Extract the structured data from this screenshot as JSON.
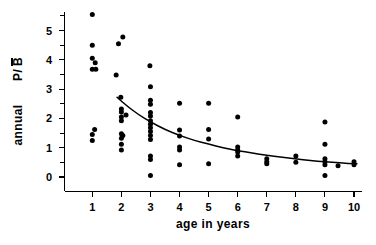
{
  "chart_data": {
    "type": "scatter",
    "title": "",
    "xlabel": "age  in  years",
    "ylabel": "annual  P/B̄",
    "ylabel_parts": {
      "word": "annual",
      "symbol_p": "P/",
      "symbol_b": "B",
      "has_overbar_on_b": true
    },
    "xlim": [
      0.35,
      10.55
    ],
    "ylim": [
      -0.35,
      5.75
    ],
    "xticks": [
      1,
      2,
      3,
      4,
      5,
      6,
      7,
      8,
      9,
      10
    ],
    "xtick_labels": [
      "1",
      "2",
      "3",
      "4",
      "5",
      "6",
      "7",
      "8",
      "9",
      "10"
    ],
    "yticks": [
      0,
      1,
      2,
      3,
      4,
      5
    ],
    "ytick_labels": [
      "0",
      "1",
      "2",
      "3",
      "4",
      "5"
    ],
    "yticks_minor": [
      0.5,
      1.5,
      2.5,
      3.5,
      4.5,
      5.5
    ],
    "grid": false,
    "legend": false,
    "marker": "filled-circle",
    "marker_color": "#000000",
    "marker_size_px": 2.5,
    "points": [
      {
        "x": 1.0,
        "y": 5.55
      },
      {
        "x": 1.0,
        "y": 4.5
      },
      {
        "x": 1.0,
        "y": 4.05
      },
      {
        "x": 1.1,
        "y": 3.9
      },
      {
        "x": 1.0,
        "y": 3.68
      },
      {
        "x": 1.12,
        "y": 3.68
      },
      {
        "x": 1.08,
        "y": 1.62
      },
      {
        "x": 1.0,
        "y": 1.45
      },
      {
        "x": 1.0,
        "y": 1.25
      },
      {
        "x": 1.9,
        "y": 4.55
      },
      {
        "x": 2.05,
        "y": 4.78
      },
      {
        "x": 1.82,
        "y": 3.48
      },
      {
        "x": 1.98,
        "y": 2.72
      },
      {
        "x": 2.0,
        "y": 2.32
      },
      {
        "x": 2.0,
        "y": 2.22
      },
      {
        "x": 2.16,
        "y": 2.12
      },
      {
        "x": 2.0,
        "y": 2.05
      },
      {
        "x": 2.0,
        "y": 1.92
      },
      {
        "x": 2.0,
        "y": 1.48
      },
      {
        "x": 2.05,
        "y": 1.42
      },
      {
        "x": 2.0,
        "y": 1.32
      },
      {
        "x": 2.0,
        "y": 1.12
      },
      {
        "x": 2.0,
        "y": 0.92
      },
      {
        "x": 2.98,
        "y": 3.8
      },
      {
        "x": 3.0,
        "y": 3.08
      },
      {
        "x": 3.0,
        "y": 2.62
      },
      {
        "x": 3.0,
        "y": 2.48
      },
      {
        "x": 3.0,
        "y": 2.2
      },
      {
        "x": 3.0,
        "y": 2.08
      },
      {
        "x": 3.0,
        "y": 1.92
      },
      {
        "x": 3.0,
        "y": 1.8
      },
      {
        "x": 3.0,
        "y": 1.68
      },
      {
        "x": 3.0,
        "y": 1.55
      },
      {
        "x": 3.0,
        "y": 1.42
      },
      {
        "x": 3.0,
        "y": 1.28
      },
      {
        "x": 3.0,
        "y": 0.72
      },
      {
        "x": 3.0,
        "y": 0.6
      },
      {
        "x": 3.0,
        "y": 0.05
      },
      {
        "x": 4.0,
        "y": 2.52
      },
      {
        "x": 4.0,
        "y": 1.6
      },
      {
        "x": 4.0,
        "y": 1.4
      },
      {
        "x": 4.0,
        "y": 1.02
      },
      {
        "x": 4.0,
        "y": 0.92
      },
      {
        "x": 4.0,
        "y": 0.42
      },
      {
        "x": 5.0,
        "y": 2.52
      },
      {
        "x": 5.0,
        "y": 1.62
      },
      {
        "x": 5.0,
        "y": 1.3
      },
      {
        "x": 5.0,
        "y": 0.45
      },
      {
        "x": 6.0,
        "y": 2.05
      },
      {
        "x": 6.0,
        "y": 1.02
      },
      {
        "x": 6.0,
        "y": 0.92
      },
      {
        "x": 6.0,
        "y": 0.85
      },
      {
        "x": 6.0,
        "y": 0.72
      },
      {
        "x": 7.0,
        "y": 0.62
      },
      {
        "x": 7.0,
        "y": 0.52
      },
      {
        "x": 7.0,
        "y": 0.45
      },
      {
        "x": 8.0,
        "y": 0.72
      },
      {
        "x": 8.0,
        "y": 0.5
      },
      {
        "x": 9.0,
        "y": 1.88
      },
      {
        "x": 9.0,
        "y": 1.12
      },
      {
        "x": 9.0,
        "y": 0.62
      },
      {
        "x": 9.0,
        "y": 0.52
      },
      {
        "x": 9.0,
        "y": 0.42
      },
      {
        "x": 9.0,
        "y": 0.05
      },
      {
        "x": 9.45,
        "y": 0.38
      },
      {
        "x": 10.0,
        "y": 0.52
      },
      {
        "x": 10.0,
        "y": 0.42
      }
    ],
    "fit_curve": {
      "name": "fitted decline curve",
      "style": "solid-black",
      "points": [
        {
          "x": 1.85,
          "y": 2.72
        },
        {
          "x": 2.2,
          "y": 2.42
        },
        {
          "x": 2.6,
          "y": 2.12
        },
        {
          "x": 3.0,
          "y": 1.88
        },
        {
          "x": 3.5,
          "y": 1.62
        },
        {
          "x": 4.0,
          "y": 1.42
        },
        {
          "x": 4.5,
          "y": 1.25
        },
        {
          "x": 5.0,
          "y": 1.12
        },
        {
          "x": 5.5,
          "y": 1.0
        },
        {
          "x": 6.0,
          "y": 0.9
        },
        {
          "x": 6.5,
          "y": 0.82
        },
        {
          "x": 7.0,
          "y": 0.74
        },
        {
          "x": 7.5,
          "y": 0.68
        },
        {
          "x": 8.0,
          "y": 0.62
        },
        {
          "x": 8.5,
          "y": 0.56
        },
        {
          "x": 9.0,
          "y": 0.52
        },
        {
          "x": 9.5,
          "y": 0.48
        },
        {
          "x": 10.1,
          "y": 0.45
        }
      ]
    }
  },
  "colors": {
    "axis": "#000000",
    "marker": "#000000",
    "curve": "#000000",
    "background": "#ffffff"
  }
}
